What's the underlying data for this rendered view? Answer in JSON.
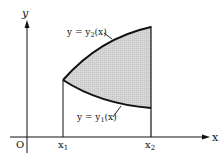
{
  "diagram": {
    "type": "area-between-curves",
    "axes": {
      "x_label": "x",
      "y_label": "y",
      "origin_label": "O"
    },
    "bounds": {
      "left_label": "x",
      "left_sub": "1",
      "right_label": "x",
      "right_sub": "2"
    },
    "curves": {
      "upper": {
        "label_prefix": "y = y",
        "label_sub": "2",
        "label_suffix": "(x)"
      },
      "lower": {
        "label_prefix": "y = y",
        "label_sub": "1",
        "label_suffix": "(x)"
      }
    },
    "colors": {
      "line": "#111111",
      "shade": "#d4d4d4",
      "background": "#ffffff"
    }
  }
}
